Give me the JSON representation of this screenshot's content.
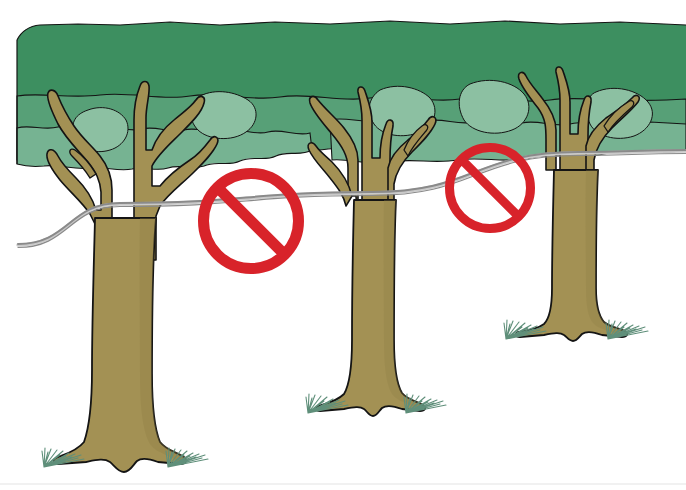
{
  "illustration": {
    "title": "Trees connected by a wire with prohibition signs",
    "subject": "no-climbing-wire-between-trees",
    "background_color": "#ffffff",
    "canvas": {
      "width": 686,
      "height": 490
    }
  },
  "palette": {
    "background": "#ffffff",
    "canopy_dark_green": "#3d8f60",
    "canopy_mid_green": "#57a077",
    "canopy_light_green": "#76b392",
    "canopy_pale_green": "#8cc0a2",
    "trunk_fill": "#a39154",
    "trunk_shadow": "#8e7d45",
    "outline": "#141414",
    "wire_gray": "#8a8a8a",
    "wire_light": "#c9c9c9",
    "grass_green": "#5f8f7a",
    "sign_red": "#d8232a",
    "scan_edge_gray": "#e6e6e6"
  },
  "canopy": {
    "label": "tree canopy foliage band",
    "top_y": 24,
    "bottom_y": 168,
    "left_x": 17,
    "right_x": 686
  },
  "trees": [
    {
      "id": "tree-left",
      "label": "Left tree",
      "trunk_center_x": 128,
      "base_y": 470,
      "crown_top_y": 60,
      "has_grass": true,
      "grass_tufts": 2
    },
    {
      "id": "tree-middle",
      "label": "Middle tree",
      "trunk_center_x": 372,
      "base_y": 418,
      "crown_top_y": 85,
      "has_grass": true,
      "grass_tufts": 2
    },
    {
      "id": "tree-right",
      "label": "Right tree",
      "trunk_center_x": 572,
      "base_y": 340,
      "crown_top_y": 60,
      "has_grass": true,
      "grass_tufts": 2
    }
  ],
  "wire": {
    "label": "wire strung between the trees",
    "color": "#8a8a8a",
    "stroke_width": 2,
    "anchor_points": [
      {
        "x": 18,
        "y": 244
      },
      {
        "x": 120,
        "y": 203
      },
      {
        "x": 372,
        "y": 192
      },
      {
        "x": 578,
        "y": 152
      },
      {
        "x": 686,
        "y": 150
      }
    ],
    "segments": 4
  },
  "signs": [
    {
      "id": "sign-left",
      "label": "Prohibition sign (no entry) hanging on wire, left",
      "type": "prohibition",
      "center_x": 251,
      "center_y": 221,
      "radius": 53,
      "ring_width": 11,
      "color": "#d8232a",
      "slash_angle_deg": 45
    },
    {
      "id": "sign-right",
      "label": "Prohibition sign (no entry) hanging on wire, right",
      "type": "prohibition",
      "center_x": 490,
      "center_y": 188,
      "radius": 45,
      "ring_width": 9,
      "color": "#d8232a",
      "slash_angle_deg": 45
    }
  ],
  "scan_artifact": {
    "label": "faint scanner edge line at bottom",
    "y": 484,
    "color": "#ededed"
  }
}
